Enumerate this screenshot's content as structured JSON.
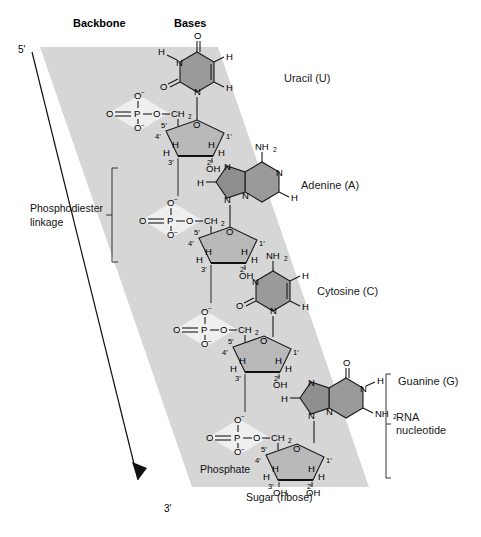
{
  "figure": {
    "headers": {
      "backbone": "Backbone",
      "bases": "Bases"
    },
    "ends": {
      "five_prime": "5′",
      "three_prime": "3′"
    },
    "annotations": {
      "phosphodiester_line1": "Phosphodiester",
      "phosphodiester_line2": "linkage",
      "phosphate": "Phosphate",
      "sugar": "Sugar (ribose)",
      "rna_nucleotide_line1": "RNA",
      "rna_nucleotide_line2": "nucleotide"
    },
    "base_labels": [
      {
        "id": "uracil",
        "text": "Uracil (U)"
      },
      {
        "id": "adenine",
        "text": "Adenine (A)"
      },
      {
        "id": "cytosine",
        "text": "Cytosine (C)"
      },
      {
        "id": "guanine",
        "text": "Guanine (G)"
      }
    ],
    "atoms": {
      "oxygen": "O",
      "nitrogen": "N",
      "phosphorus": "P",
      "hydrogen": "H",
      "carbon": "C",
      "amine": "NH",
      "hydroxyl": "OH",
      "methylene": "CH",
      "oxygen_minus": "O",
      "minus": "−",
      "sub2": "2"
    },
    "sugar_carbons": {
      "c1": "1",
      "c2": "2",
      "c3": "3",
      "c4": "4",
      "c5": "5",
      "prime": "′"
    },
    "colors": {
      "band": "#d6d6d6",
      "phosphate_diamond": "#efefef",
      "sugar_ring": "#b9b9b9",
      "base_ring": "#9a9a9a",
      "ink": "#1a1a1a",
      "page": "#ffffff"
    },
    "nucleotide_count": 4
  }
}
